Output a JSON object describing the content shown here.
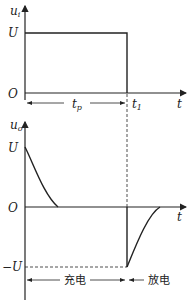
{
  "top_plot": {
    "y_axis_label": "u",
    "y_axis_sub": "i",
    "level_label": "U",
    "origin_label": "O",
    "x_axis_label": "t",
    "pulse_width_label": "t",
    "pulse_width_sub": "p",
    "edge_label": "t",
    "edge_sub": "1"
  },
  "bottom_plot": {
    "y_axis_label": "u",
    "y_axis_sub": "o",
    "pos_level_label": "U",
    "origin_label": "O",
    "neg_level_label": "−U",
    "x_axis_label": "t",
    "charge_label": "充电",
    "discharge_label": "放电"
  }
}
